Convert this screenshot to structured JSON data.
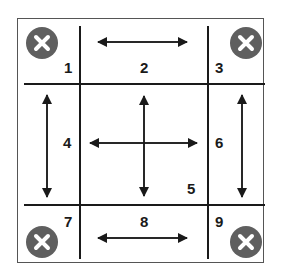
{
  "diagram": {
    "cells": [
      {
        "id": 1,
        "label": "1",
        "role": "corner",
        "icon": "close-icon",
        "arrows": "none"
      },
      {
        "id": 2,
        "label": "2",
        "role": "edge",
        "arrows": "horizontal"
      },
      {
        "id": 3,
        "label": "3",
        "role": "corner",
        "icon": "close-icon",
        "arrows": "none"
      },
      {
        "id": 4,
        "label": "4",
        "role": "edge",
        "arrows": "vertical"
      },
      {
        "id": 5,
        "label": "5",
        "role": "center",
        "arrows": "four-way"
      },
      {
        "id": 6,
        "label": "6",
        "role": "edge",
        "arrows": "vertical"
      },
      {
        "id": 7,
        "label": "7",
        "role": "corner",
        "icon": "close-icon",
        "arrows": "none"
      },
      {
        "id": 8,
        "label": "8",
        "role": "edge",
        "arrows": "horizontal"
      },
      {
        "id": 9,
        "label": "9",
        "role": "corner",
        "icon": "close-icon",
        "arrows": "none"
      }
    ],
    "colors": {
      "line": "#1a1a1a",
      "frame": "#555555",
      "icon_bg": "#5f5f5f",
      "icon_fg": "#ffffff",
      "background": "#ffffff"
    }
  }
}
